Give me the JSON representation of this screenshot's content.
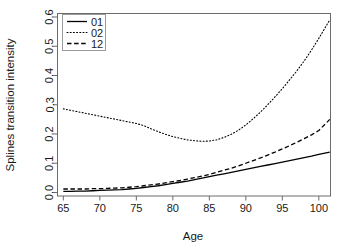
{
  "chart_data": {
    "type": "line",
    "title": "",
    "xlabel": "Age",
    "ylabel": "Splines transition intensity",
    "xlim": [
      64.2,
      101.6
    ],
    "ylim": [
      -0.012,
      0.612
    ],
    "xticks": [
      65,
      70,
      75,
      80,
      85,
      90,
      95,
      100
    ],
    "xtick_labels": [
      "65",
      "70",
      "75",
      "80",
      "85",
      "90",
      "95",
      "100"
    ],
    "yticks": [
      0.0,
      0.1,
      0.2,
      0.3,
      0.4,
      0.5,
      0.6
    ],
    "ytick_labels": [
      "0.0",
      "0.1",
      "0.2",
      "0.3",
      "0.4",
      "0.5",
      "0.6"
    ],
    "grid": false,
    "legend_position": "top-left",
    "x": [
      65,
      66,
      67,
      68,
      69,
      70,
      71,
      72,
      73,
      74,
      75,
      76,
      77,
      78,
      79,
      80,
      81,
      82,
      83,
      84,
      85,
      86,
      87,
      88,
      89,
      90,
      91,
      92,
      93,
      94,
      95,
      96,
      97,
      98,
      99,
      100,
      101.5
    ],
    "series": [
      {
        "name": "01",
        "label": "01",
        "linestyle": "solid",
        "color": "#000000",
        "values": [
          0.004,
          0.004,
          0.005,
          0.005,
          0.006,
          0.007,
          0.008,
          0.009,
          0.01,
          0.012,
          0.014,
          0.017,
          0.02,
          0.023,
          0.027,
          0.031,
          0.035,
          0.039,
          0.044,
          0.049,
          0.054,
          0.059,
          0.064,
          0.069,
          0.074,
          0.079,
          0.084,
          0.089,
          0.094,
          0.099,
          0.104,
          0.109,
          0.114,
          0.119,
          0.124,
          0.13,
          0.138
        ]
      },
      {
        "name": "02",
        "label": "02",
        "linestyle": "dotted",
        "color": "#000000",
        "values": [
          0.286,
          0.281,
          0.276,
          0.271,
          0.266,
          0.261,
          0.256,
          0.251,
          0.246,
          0.241,
          0.236,
          0.229,
          0.218,
          0.208,
          0.199,
          0.191,
          0.185,
          0.18,
          0.177,
          0.175,
          0.176,
          0.18,
          0.188,
          0.199,
          0.213,
          0.231,
          0.252,
          0.275,
          0.3,
          0.327,
          0.355,
          0.385,
          0.416,
          0.45,
          0.487,
          0.527,
          0.59
        ]
      },
      {
        "name": "12",
        "label": "12",
        "linestyle": "dashed",
        "color": "#000000",
        "values": [
          0.012,
          0.012,
          0.012,
          0.012,
          0.013,
          0.013,
          0.014,
          0.015,
          0.016,
          0.018,
          0.02,
          0.023,
          0.026,
          0.029,
          0.033,
          0.037,
          0.041,
          0.046,
          0.051,
          0.056,
          0.062,
          0.069,
          0.076,
          0.083,
          0.091,
          0.1,
          0.109,
          0.118,
          0.128,
          0.138,
          0.149,
          0.16,
          0.172,
          0.184,
          0.197,
          0.212,
          0.25
        ]
      }
    ]
  },
  "legend": {
    "entries": [
      {
        "label": "01"
      },
      {
        "label": "02"
      },
      {
        "label": "12"
      }
    ]
  }
}
